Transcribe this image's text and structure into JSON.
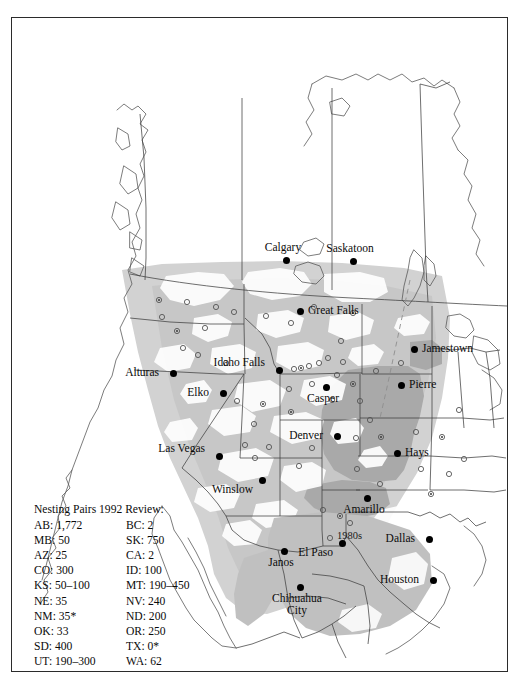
{
  "map": {
    "title_visible": false,
    "frame": {
      "stroke": "#2b2b2b"
    },
    "colors": {
      "land": "#ffffff",
      "range_light": "#d2d2d2",
      "range_medium": "#c2c2c2",
      "range_dark": "#a8a8a8",
      "coast": "#4a4a4a",
      "border": "#3d3d3d",
      "dot": "#000000",
      "open_marker": "#555555"
    },
    "cities": [
      {
        "name": "Calgary",
        "label": "Calgary",
        "x": 274,
        "y": 242,
        "pos": "above"
      },
      {
        "name": "Saskatoon",
        "label": "Saskatoon",
        "x": 341,
        "y": 243,
        "pos": "above"
      },
      {
        "name": "Great Falls",
        "label": "Great Falls",
        "x": 288,
        "y": 293,
        "pos": "right"
      },
      {
        "name": "Jamestown",
        "label": "Jamestown",
        "x": 402,
        "y": 331,
        "pos": "right"
      },
      {
        "name": "Alturas",
        "label": "Alturas",
        "x": 161,
        "y": 355,
        "pos": "left"
      },
      {
        "name": "Idaho Falls",
        "label": "Idaho Falls",
        "x": 267,
        "y": 352,
        "pos": "left2"
      },
      {
        "name": "Pierre",
        "label": "Pierre",
        "x": 389,
        "y": 367,
        "pos": "right"
      },
      {
        "name": "Elko",
        "label": "Elko",
        "x": 211,
        "y": 375,
        "pos": "left"
      },
      {
        "name": "Casper",
        "label": "Casper",
        "x": 314,
        "y": 369,
        "pos": "below"
      },
      {
        "name": "Denver",
        "label": "Denver",
        "x": 325,
        "y": 418,
        "pos": "left"
      },
      {
        "name": "Hays",
        "label": "Hays",
        "x": 385,
        "y": 435,
        "pos": "right"
      },
      {
        "name": "Las Vegas",
        "label": "Las Vegas",
        "x": 207,
        "y": 438,
        "pos": "left2"
      },
      {
        "name": "Winslow",
        "label": "Winslow",
        "x": 250,
        "y": 462,
        "pos": "bl"
      },
      {
        "name": "Amarillo",
        "label": "Amarillo",
        "x": 355,
        "y": 480,
        "pos": "below"
      },
      {
        "name": "El Paso",
        "label": "El Paso",
        "x": 330,
        "y": 525,
        "pos": "bl"
      },
      {
        "name": "Dallas",
        "label": "Dallas",
        "x": 417,
        "y": 521,
        "pos": "left"
      },
      {
        "name": "Janos",
        "label": "Janos",
        "x": 272,
        "y": 533,
        "pos": "below"
      },
      {
        "name": "Chihuahua City",
        "label": "Chihuahua City",
        "x": 288,
        "y": 569,
        "pos": "below2"
      },
      {
        "name": "Houston",
        "label": "Houston",
        "x": 421,
        "y": 562,
        "pos": "left"
      }
    ],
    "annotations": [
      {
        "name": "decade-1980s",
        "text": "1980s",
        "x": 325,
        "y": 512
      }
    ],
    "open_markers": [
      [
        147,
        282
      ],
      [
        175,
        284
      ],
      [
        204,
        289
      ],
      [
        222,
        294
      ],
      [
        150,
        299
      ],
      [
        165,
        313
      ],
      [
        193,
        310
      ],
      [
        254,
        298
      ],
      [
        279,
        305
      ],
      [
        302,
        289
      ],
      [
        341,
        295
      ],
      [
        329,
        323
      ],
      [
        316,
        340
      ],
      [
        297,
        348
      ],
      [
        282,
        351
      ],
      [
        289,
        350
      ],
      [
        307,
        345
      ],
      [
        331,
        344
      ],
      [
        325,
        357
      ],
      [
        300,
        366
      ],
      [
        341,
        366
      ],
      [
        277,
        371
      ],
      [
        348,
        383
      ],
      [
        320,
        382
      ],
      [
        358,
        402
      ],
      [
        279,
        394
      ],
      [
        242,
        406
      ],
      [
        225,
        383
      ],
      [
        389,
        345
      ],
      [
        364,
        353
      ],
      [
        369,
        419
      ],
      [
        404,
        414
      ],
      [
        345,
        451
      ],
      [
        368,
        466
      ],
      [
        311,
        492
      ],
      [
        328,
        498
      ],
      [
        338,
        505
      ],
      [
        318,
        520
      ],
      [
        257,
        429
      ],
      [
        233,
        427
      ],
      [
        251,
        386
      ],
      [
        243,
        440
      ],
      [
        214,
        345
      ],
      [
        186,
        337
      ],
      [
        171,
        330
      ],
      [
        430,
        419
      ],
      [
        447,
        392
      ],
      [
        452,
        441
      ],
      [
        437,
        456
      ],
      [
        409,
        451
      ],
      [
        419,
        476
      ],
      [
        344,
        420
      ],
      [
        300,
        430
      ],
      [
        287,
        448
      ]
    ]
  },
  "legend": {
    "title": "Nesting Pairs 1992 Review:",
    "rows": [
      {
        "left_key": "AB",
        "left_value": "1,772",
        "right_key": "BC",
        "right_value": "2"
      },
      {
        "left_key": "MB",
        "left_value": "50",
        "right_key": "SK",
        "right_value": "750"
      },
      {
        "left_key": "AZ",
        "left_value": "25",
        "right_key": "CA",
        "right_value": "2"
      },
      {
        "left_key": "CO",
        "left_value": "300",
        "right_key": "ID",
        "right_value": "100"
      },
      {
        "left_key": "KS",
        "left_value": "50–100",
        "right_key": "MT",
        "right_value": "190–450"
      },
      {
        "left_key": "NE",
        "left_value": "35",
        "right_key": "NV",
        "right_value": "240"
      },
      {
        "left_key": "NM",
        "left_value": "35*",
        "right_key": "ND",
        "right_value": "200"
      },
      {
        "left_key": "OK",
        "left_value": "33",
        "right_key": "OR",
        "right_value": "250"
      },
      {
        "left_key": "SD",
        "left_value": "400",
        "right_key": "TX",
        "right_value": "0*"
      },
      {
        "left_key": "UT",
        "left_value": "190–300",
        "right_key": "WA",
        "right_value": "62"
      },
      {
        "left_key": "WY",
        "left_value": "800",
        "right_key": "",
        "right_value": ""
      }
    ],
    "footnote": "* Estimates since 1992 are higher."
  }
}
